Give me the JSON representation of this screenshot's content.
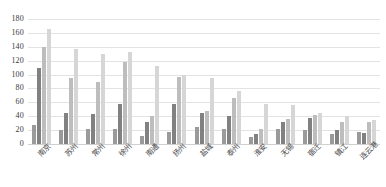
{
  "chart_data": {
    "type": "bar",
    "title": "",
    "xlabel": "",
    "ylabel": "",
    "ylim": [
      0,
      180
    ],
    "yticks": [
      180,
      160,
      140,
      120,
      100,
      80,
      60,
      40,
      20,
      0
    ],
    "grid": true,
    "legend": "none",
    "categories": [
      "南京",
      "苏州",
      "常州",
      "徐州",
      "南通",
      "扬州",
      "盐城",
      "泰州",
      "淮安",
      "无锡",
      "宿迁",
      "镇江",
      "连云港"
    ],
    "series": [
      {
        "name": "系列1",
        "color": "#9a9a9a",
        "values": [
          28,
          20,
          22,
          22,
          12,
          18,
          24,
          22,
          10,
          22,
          20,
          14,
          18
        ]
      },
      {
        "name": "系列2",
        "color": "#818181",
        "values": [
          110,
          45,
          43,
          58,
          32,
          58,
          44,
          40,
          14,
          32,
          38,
          20,
          16
        ]
      },
      {
        "name": "系列3",
        "color": "#bdbdbd",
        "values": [
          140,
          95,
          90,
          118,
          40,
          96,
          48,
          66,
          22,
          36,
          42,
          32,
          32
        ]
      },
      {
        "name": "系列4",
        "color": "#d6d6d6",
        "values": [
          165,
          137,
          130,
          132,
          112,
          100,
          95,
          76,
          58,
          56,
          44,
          40,
          34
        ]
      }
    ]
  }
}
